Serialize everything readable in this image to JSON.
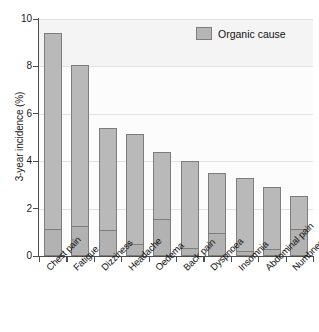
{
  "chart_data": {
    "type": "bar",
    "title": "",
    "subtitle": "",
    "xlabel": "",
    "ylabel": "3-year incidence (%)",
    "ylim": [
      0,
      10
    ],
    "ytick_labels": [
      "0",
      "2",
      "4",
      "6",
      "8",
      "10"
    ],
    "yticks": [
      0,
      2,
      4,
      6,
      8,
      10
    ],
    "grid": true,
    "grid_axis": "y",
    "legend_position": "top-right",
    "stacked": true,
    "categories": [
      "Chest pain",
      "Fatigue",
      "Dizziness",
      "Headache",
      "Oedema",
      "Back pain",
      "Dyspnoea",
      "Insomnia",
      "Abdominal pain",
      "Numbness"
    ],
    "series": [
      {
        "name": "Total incidence",
        "values": [
          9.4,
          8.05,
          5.4,
          5.15,
          4.4,
          4.0,
          3.5,
          3.3,
          2.9,
          2.55
        ]
      },
      {
        "name": "Organic cause",
        "values": [
          1.15,
          1.25,
          1.1,
          0.5,
          1.55,
          0.35,
          0.95,
          0.2,
          0.3,
          1.15
        ]
      }
    ],
    "legend": [
      {
        "label": "Organic cause",
        "color": "#b6b6b6"
      }
    ],
    "colors": {
      "bar_fill": "#b9b9b9",
      "organic_fill": "#b2b2b2",
      "bar_border": "#7d7d7d",
      "axis": "#4d4d4d",
      "gridline": "#e2e2e2",
      "plot_background": "#f4f4f4",
      "text": "#111111"
    }
  }
}
